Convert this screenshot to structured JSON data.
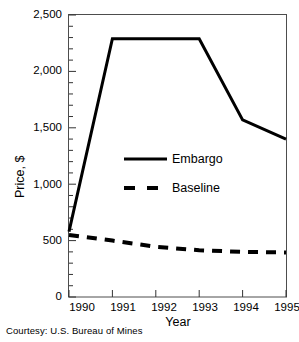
{
  "chart_data": {
    "type": "line",
    "title": "",
    "xlabel": "Year",
    "ylabel": "Price, $",
    "categories": [
      "1990",
      "1991",
      "1992",
      "1993",
      "1994",
      "1995"
    ],
    "x": [
      1990,
      1991,
      1992,
      1993,
      1994,
      1995
    ],
    "xlim": [
      1990,
      1995
    ],
    "ylim": [
      0,
      2500
    ],
    "yticks": [
      0,
      500,
      1000,
      1500,
      2000,
      2500
    ],
    "ytick_labels": [
      "0",
      "500",
      "1,000",
      "1,500",
      "2,000",
      "2,500"
    ],
    "yminor_interval": 100,
    "grid": false,
    "legend_position": "center",
    "series": [
      {
        "name": "Embargo",
        "style": "solid",
        "color": "#000000",
        "values": [
          580,
          2290,
          2290,
          2290,
          1570,
          1400
        ]
      },
      {
        "name": "Baseline",
        "style": "dashed",
        "color": "#000000",
        "values": [
          550,
          500,
          445,
          415,
          400,
          395
        ]
      }
    ],
    "annotations": []
  },
  "legend": {
    "items": [
      {
        "label": "Embargo",
        "style": "solid"
      },
      {
        "label": "Baseline",
        "style": "dashed"
      }
    ]
  },
  "caption": {
    "text": "Courtesy: U.S. Bureau of Mines"
  }
}
